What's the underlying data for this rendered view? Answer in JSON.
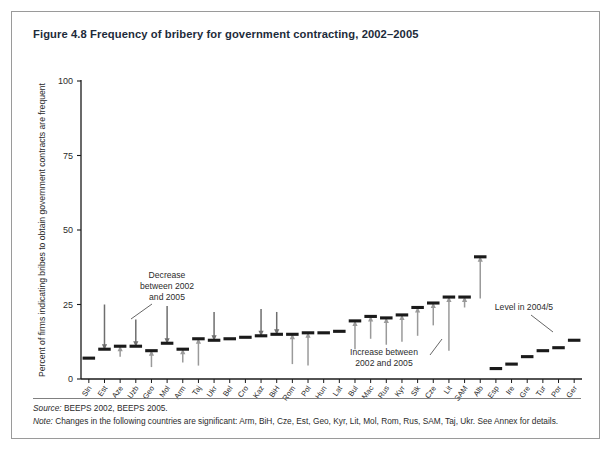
{
  "figure": {
    "title": "Figure 4.8  Frequency of bribery for government contracting, 2002–2005",
    "source_lead": "Source:",
    "source_text": " BEEPS 2002, BEEPS 2005.",
    "note_lead": "Note:",
    "note_text": " Changes in the following countries are significant: Arm, BiH, Cze, Est, Geo, Kyr, Lit, Mol, Rom, Rus, SAM, Taj, Ukr. See Annex for details."
  },
  "annotations": {
    "decrease": "Decrease\nbetween 2002\nand 2005",
    "decrease_line1": "Decrease",
    "decrease_line2": "between 2002",
    "decrease_line3": "and 2005",
    "increase_line1": "Increase between",
    "increase_line2": "2002 and 2005",
    "level_label": "Level in 2004/5"
  },
  "colors": {
    "marker": "#1a1a1a",
    "decrease_arrow": "#6e6e6e",
    "increase_arrow": "#9a9a9a",
    "axis": "#1a1a1a",
    "frame": "#9a9a9a",
    "title": "#1d2b3a"
  },
  "chart_data": {
    "type": "bar",
    "title": "Figure 4.8  Frequency of bribery for government contracting, 2002–2005",
    "xlabel": "",
    "ylabel": "Percent of firms indicating bribes to obtain government contracts are frequent",
    "ylim": [
      0,
      100
    ],
    "yticks": [
      0,
      25,
      50,
      75,
      100
    ],
    "ytick_labels": [
      "0",
      "25",
      "50",
      "75",
      "100"
    ],
    "grid": false,
    "legend": "none",
    "categories": [
      "Sln",
      "Est",
      "Aze",
      "Uzb",
      "Geo",
      "Mol",
      "Arm",
      "Taj",
      "Ukr",
      "Bel",
      "Cro",
      "Kaz",
      "BiH",
      "Rom",
      "Pol",
      "Hun",
      "Lat",
      "Bul",
      "Mac",
      "Rus",
      "Kyr",
      "Slk",
      "Cze",
      "Lit",
      "SAM",
      "Alb",
      "Esp",
      "Ire",
      "Gre",
      "Tur",
      "Por",
      "Ger"
    ],
    "series": [
      {
        "name": "Level in 2004/5",
        "values": [
          7,
          10,
          11,
          11,
          9.5,
          12,
          10,
          13.5,
          13,
          13.5,
          14,
          14.5,
          15,
          15,
          15.5,
          15.5,
          16,
          19.5,
          21,
          20.5,
          21.5,
          24,
          25.5,
          27.5,
          27.5,
          41,
          3.5,
          5,
          7.5,
          9.5,
          10.5,
          13
        ]
      },
      {
        "name": "Level in 2002",
        "values": [
          null,
          25,
          7.5,
          20,
          4,
          24.5,
          5.5,
          4.5,
          22.5,
          null,
          null,
          23.5,
          22.5,
          5,
          4.5,
          null,
          null,
          10,
          13.5,
          11.5,
          12.5,
          14.5,
          18,
          9.5,
          24,
          27,
          null,
          null,
          null,
          null,
          null,
          null
        ]
      }
    ],
    "change_direction": [
      "none",
      "decrease",
      "increase",
      "decrease",
      "increase",
      "decrease",
      "increase",
      "increase",
      "decrease",
      "none",
      "none",
      "decrease",
      "decrease",
      "increase",
      "increase",
      "none",
      "none",
      "increase",
      "increase",
      "increase",
      "increase",
      "increase",
      "increase",
      "increase",
      "increase",
      "increase",
      "none",
      "none",
      "none",
      "none",
      "none",
      "none"
    ]
  }
}
